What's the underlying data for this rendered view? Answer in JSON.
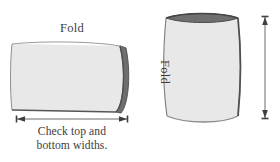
{
  "figure": {
    "title_absent": true,
    "background_color": "#ffffff",
    "ink_color": "#3d3d3d",
    "texture_color_light": "#f2f2f2",
    "texture_color_speck": "#c9c9c9",
    "edge_dark_color": "#4a4a4a",
    "edge_mid_color": "#8a8a8a"
  },
  "panels": [
    {
      "id": "top-bottom-widths",
      "label_top": "Fold",
      "shape_name": "folded-sheet-horizontal",
      "dimension_arrow": "horizontal-double-arrow",
      "caption_line1": "Check top and",
      "caption_line2": "bottom widths."
    },
    {
      "id": "side-lengths",
      "label_side": "Fold",
      "shape_name": "cylinder-vertical",
      "dimension_arrow": "vertical-double-arrow",
      "caption_line1": "Check side lengths.",
      "caption_line2": ""
    }
  ]
}
